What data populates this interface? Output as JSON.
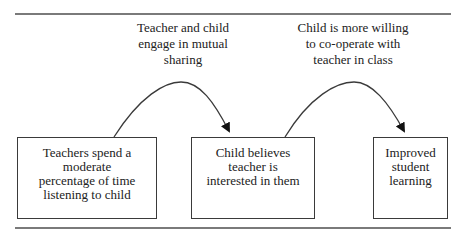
{
  "diagram": {
    "type": "flow",
    "nodes": [
      {
        "id": "n1",
        "text": [
          "Teachers spend a",
          "moderate",
          "percentage of time",
          "listening to child"
        ]
      },
      {
        "id": "n2",
        "text": [
          "Child believes",
          "teacher is",
          "interested in them"
        ]
      },
      {
        "id": "n3",
        "text": [
          "Improved",
          "student",
          "learning"
        ]
      }
    ],
    "edges": [
      {
        "from": "n1",
        "to": "n2",
        "label": [
          "Teacher and child",
          "engage in mutual",
          "sharing"
        ]
      },
      {
        "from": "n2",
        "to": "n3",
        "label": [
          "Child is more willing",
          "to co-operate with",
          "teacher in class"
        ]
      }
    ],
    "colors": {
      "line": "#3a3a3a",
      "rule": "#7a7a7a",
      "background": "#ffffff"
    }
  }
}
